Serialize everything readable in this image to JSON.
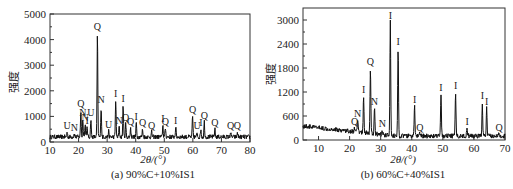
{
  "chart_data": [
    {
      "id": "a",
      "type": "line",
      "title": "",
      "caption": "(a) 90%C+10%IS1",
      "xlabel": "2θ/(°)",
      "ylabel": "强度",
      "xlim": [
        10,
        80
      ],
      "ylim": [
        0,
        5000
      ],
      "xticks": [
        10,
        20,
        30,
        40,
        50,
        60,
        70,
        80
      ],
      "yticks": [
        0,
        1000,
        2000,
        3000,
        4000,
        5000
      ],
      "grid": false,
      "baseline": 200,
      "peaks": [
        {
          "x": 16.0,
          "y": 380,
          "label": "U"
        },
        {
          "x": 18.5,
          "y": 320,
          "label": "N"
        },
        {
          "x": 20.8,
          "y": 1250,
          "label": "Q"
        },
        {
          "x": 21.5,
          "y": 900,
          "label": "N"
        },
        {
          "x": 22.3,
          "y": 700,
          "label": "N"
        },
        {
          "x": 23.0,
          "y": 600,
          "label": "I"
        },
        {
          "x": 24.3,
          "y": 900,
          "label": "U"
        },
        {
          "x": 26.6,
          "y": 4250,
          "label": "Q"
        },
        {
          "x": 27.9,
          "y": 1400,
          "label": "N"
        },
        {
          "x": 30.5,
          "y": 420,
          "label": "U"
        },
        {
          "x": 33.0,
          "y": 1650,
          "label": "I"
        },
        {
          "x": 34.2,
          "y": 600,
          "label": "N"
        },
        {
          "x": 35.6,
          "y": 1450,
          "label": "I"
        },
        {
          "x": 36.5,
          "y": 700,
          "label": "Q"
        },
        {
          "x": 38.2,
          "y": 550,
          "label": "Q"
        },
        {
          "x": 40.2,
          "y": 750,
          "label": "I"
        },
        {
          "x": 42.4,
          "y": 500,
          "label": "Q"
        },
        {
          "x": 45.6,
          "y": 400,
          "label": "Q"
        },
        {
          "x": 49.5,
          "y": 650,
          "label": "I"
        },
        {
          "x": 50.4,
          "y": 550,
          "label": "Q"
        },
        {
          "x": 54.0,
          "y": 600,
          "label": "I"
        },
        {
          "x": 59.9,
          "y": 1000,
          "label": "Q"
        },
        {
          "x": 61.5,
          "y": 380,
          "label": "U"
        },
        {
          "x": 62.8,
          "y": 500,
          "label": "I"
        },
        {
          "x": 64.0,
          "y": 800,
          "label": "Q"
        },
        {
          "x": 67.7,
          "y": 500,
          "label": "Q"
        },
        {
          "x": 73.2,
          "y": 380,
          "label": "Q"
        },
        {
          "x": 75.6,
          "y": 380,
          "label": "Q"
        }
      ]
    },
    {
      "id": "b",
      "type": "line",
      "title": "",
      "caption": "(b) 60%C+40%IS1",
      "xlabel": "2θ/(°)",
      "ylabel": "强度",
      "xlim": [
        5,
        70
      ],
      "ylim": [
        0,
        3300
      ],
      "xticks": [
        10,
        20,
        30,
        40,
        50,
        60,
        70
      ],
      "yticks": [
        0,
        600,
        1200,
        1800,
        2400,
        3000
      ],
      "grid": false,
      "baseline_start": 350,
      "baseline_end": 100,
      "peaks": [
        {
          "x": 21.6,
          "y": 300,
          "label": "Q"
        },
        {
          "x": 22.6,
          "y": 500,
          "label": "N"
        },
        {
          "x": 24.5,
          "y": 1100,
          "label": "I"
        },
        {
          "x": 26.7,
          "y": 1800,
          "label": "Q"
        },
        {
          "x": 28.0,
          "y": 800,
          "label": "N"
        },
        {
          "x": 30.5,
          "y": 250,
          "label": "N"
        },
        {
          "x": 33.1,
          "y": 2950,
          "label": "I"
        },
        {
          "x": 35.6,
          "y": 2300,
          "label": "I"
        },
        {
          "x": 40.9,
          "y": 850,
          "label": "I"
        },
        {
          "x": 42.6,
          "y": 150,
          "label": "Q"
        },
        {
          "x": 49.4,
          "y": 1150,
          "label": "I"
        },
        {
          "x": 54.1,
          "y": 1200,
          "label": "I"
        },
        {
          "x": 57.8,
          "y": 300,
          "label": "I"
        },
        {
          "x": 62.7,
          "y": 950,
          "label": "I"
        },
        {
          "x": 64.1,
          "y": 800,
          "label": "I"
        },
        {
          "x": 68.1,
          "y": 150,
          "label": "Q"
        }
      ]
    }
  ]
}
